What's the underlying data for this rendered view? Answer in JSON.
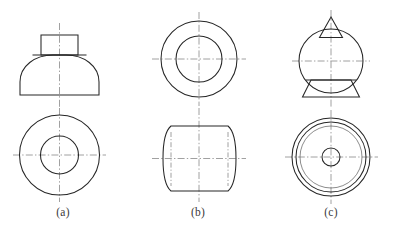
{
  "figure": {
    "background_color": "#ffffff",
    "line_color": "#262626",
    "centerline_color": "#6d6d6d",
    "thin_line_color": "#5a5a5a",
    "width": 400,
    "height": 234
  },
  "captions": {
    "a": "(a)",
    "b": "(b)",
    "c": "(c)"
  },
  "parts": [
    {
      "id": "a",
      "label": "(a)",
      "description": "Truncated cone / bell body with square boss on top; circular top view with concentric bore",
      "front_view": {
        "name": "front-view-a",
        "boss": {
          "x": 41,
          "y": 35,
          "width": 37,
          "height": 20
        },
        "body": {
          "left": 20,
          "right": 99,
          "top": 55,
          "bottom": 95,
          "profile": "convex-flare"
        },
        "centerline": {
          "x": 59.5,
          "y1": 23,
          "y2": 108
        }
      },
      "top_view": {
        "name": "top-view-a",
        "center": {
          "cx": 59.5,
          "cy": 155
        },
        "circles": [
          {
            "name": "outer-circle",
            "r": 40
          },
          {
            "name": "bore-circle",
            "r": 19
          }
        ],
        "centerline_h": {
          "x1": 13,
          "x2": 106,
          "y": 155
        },
        "centerline_v": {
          "y1": 108,
          "y2": 202,
          "x": 59.5
        }
      }
    },
    {
      "id": "b",
      "label": "(b)",
      "description": "Cylinder with spherical sides (barrel) and through bore; circular front view with concentric bore",
      "front_view": {
        "name": "front-view-b",
        "center": {
          "cx": 199,
          "cy": 59
        },
        "circles": [
          {
            "name": "outer-circle",
            "r": 38
          },
          {
            "name": "bore-circle",
            "r": 23
          }
        ],
        "centerline_h": {
          "x1": 152,
          "x2": 246,
          "y": 59
        },
        "centerline_v": {
          "y1": 12,
          "y2": 106,
          "x": 199
        }
      },
      "top_view": {
        "name": "top-view-b",
        "barrel": {
          "left": 163,
          "right": 236,
          "top": 126,
          "bottom": 191,
          "flat_left": 171,
          "flat_right": 228
        },
        "centerline_h": {
          "x1": 152,
          "x2": 246,
          "y": 158.5
        },
        "centerline_v": {
          "y1": 108,
          "y2": 202,
          "x": 199
        },
        "aux_centerlines_v": [
          {
            "x": 171,
            "y1": 132,
            "y2": 186
          },
          {
            "x": 228,
            "y1": 132,
            "y2": 186
          }
        ]
      }
    },
    {
      "id": "c",
      "label": "(c)",
      "description": "Sphere with conical point on top and flared conical skirt at bottom; bottom view with concentric circles and small center bore",
      "front_view": {
        "name": "front-view-c",
        "cone": {
          "apex_x": 331,
          "apex_y": 17,
          "base_left": 320,
          "base_right": 342,
          "base_y": 37
        },
        "sphere": {
          "cx": 331,
          "cy": 61,
          "r": 32
        },
        "skirt": {
          "top_left": 312,
          "top_right": 350,
          "top_y": 80,
          "bottom_left": 303,
          "bottom_right": 359,
          "bottom_y": 97
        },
        "centerline": {
          "x": 331,
          "y1": 10,
          "y2": 108
        }
      },
      "bottom_view": {
        "name": "bottom-view-c",
        "center": {
          "cx": 331,
          "cy": 157
        },
        "circles": [
          {
            "name": "outer-circle",
            "r": 39,
            "weight": "thick"
          },
          {
            "name": "second-circle",
            "r": 35,
            "weight": "thick"
          },
          {
            "name": "hidden-sphere-circle",
            "r": 31,
            "weight": "thin"
          },
          {
            "name": "center-bore-circle",
            "r": 9,
            "weight": "thick"
          }
        ],
        "centerline_h": {
          "x1": 285,
          "x2": 378,
          "y": 157
        },
        "centerline_v": {
          "y1": 110,
          "y2": 204,
          "x": 331
        }
      }
    }
  ]
}
